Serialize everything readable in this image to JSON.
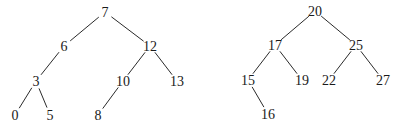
{
  "trees": [
    {
      "name": "left-tree",
      "nodes": [
        {
          "id": "n7",
          "label": "7",
          "x": 105,
          "y": 12
        },
        {
          "id": "n6",
          "label": "6",
          "x": 64,
          "y": 46
        },
        {
          "id": "n12",
          "label": "12",
          "x": 150,
          "y": 46
        },
        {
          "id": "n3",
          "label": "3",
          "x": 36,
          "y": 81
        },
        {
          "id": "n10",
          "label": "10",
          "x": 123,
          "y": 81
        },
        {
          "id": "n13",
          "label": "13",
          "x": 177,
          "y": 81
        },
        {
          "id": "n0",
          "label": "0",
          "x": 15,
          "y": 115
        },
        {
          "id": "n5",
          "label": "5",
          "x": 50,
          "y": 115
        },
        {
          "id": "n8",
          "label": "8",
          "x": 98,
          "y": 115
        }
      ],
      "edges": [
        [
          "n7",
          "n6"
        ],
        [
          "n7",
          "n12"
        ],
        [
          "n6",
          "n3"
        ],
        [
          "n12",
          "n10"
        ],
        [
          "n12",
          "n13"
        ],
        [
          "n3",
          "n0"
        ],
        [
          "n3",
          "n5"
        ],
        [
          "n10",
          "n8"
        ]
      ]
    },
    {
      "name": "right-tree",
      "nodes": [
        {
          "id": "m20",
          "label": "20",
          "x": 315,
          "y": 11
        },
        {
          "id": "m17",
          "label": "17",
          "x": 275,
          "y": 45
        },
        {
          "id": "m25",
          "label": "25",
          "x": 356,
          "y": 45
        },
        {
          "id": "m15",
          "label": "15",
          "x": 248,
          "y": 80
        },
        {
          "id": "m19",
          "label": "19",
          "x": 302,
          "y": 80
        },
        {
          "id": "m22",
          "label": "22",
          "x": 329,
          "y": 80
        },
        {
          "id": "m27",
          "label": "27",
          "x": 383,
          "y": 80
        },
        {
          "id": "m16",
          "label": "16",
          "x": 268,
          "y": 114
        }
      ],
      "edges": [
        [
          "m20",
          "m17"
        ],
        [
          "m20",
          "m25"
        ],
        [
          "m17",
          "m15"
        ],
        [
          "m17",
          "m19"
        ],
        [
          "m25",
          "m22"
        ],
        [
          "m25",
          "m27"
        ],
        [
          "m15",
          "m16"
        ]
      ]
    }
  ]
}
